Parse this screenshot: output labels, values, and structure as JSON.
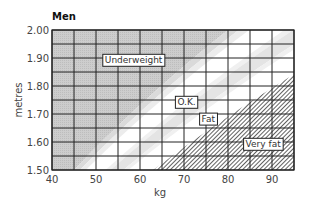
{
  "chart_data": {
    "type": "area",
    "title": "Men",
    "xlabel": "kg",
    "ylabel": "metres",
    "xlim": [
      40,
      95
    ],
    "ylim": [
      1.5,
      2.0
    ],
    "x_ticks": [
      40,
      50,
      60,
      70,
      80,
      90
    ],
    "x_tick_labels": [
      "40",
      "50",
      "60",
      "70",
      "80",
      "90"
    ],
    "y_ticks": [
      1.5,
      1.6,
      1.7,
      1.8,
      1.9,
      2.0
    ],
    "y_tick_labels": [
      "1.50",
      "1.60",
      "1.70",
      "1.80",
      "1.90",
      "2.00"
    ],
    "grid": {
      "on": true,
      "x_step": 5,
      "y_step": 0.05
    },
    "zones": [
      {
        "name": "Underweight",
        "bmi_max": 20,
        "fill": "dark-gray",
        "label_at": {
          "kg": 52,
          "m": 1.89
        }
      },
      {
        "name": "O.K.",
        "bmi_min": 21,
        "bmi_max": 23.5,
        "fill": "white",
        "label_at": {
          "kg": 68.5,
          "m": 1.74
        }
      },
      {
        "name": "Fat",
        "bmi_min": 23.5,
        "bmi_max": 25,
        "fill": "light-gray",
        "label_at": {
          "kg": 74,
          "m": 1.68
        }
      },
      {
        "name": "Very fat",
        "bmi_min": 28,
        "fill": "hatched",
        "label_at": {
          "kg": 84,
          "m": 1.59
        }
      }
    ],
    "colors": {
      "underweight": "#c9c9c9",
      "light_band": "#e4e4e4",
      "hatch": "#444444",
      "grid": "#222222"
    }
  }
}
